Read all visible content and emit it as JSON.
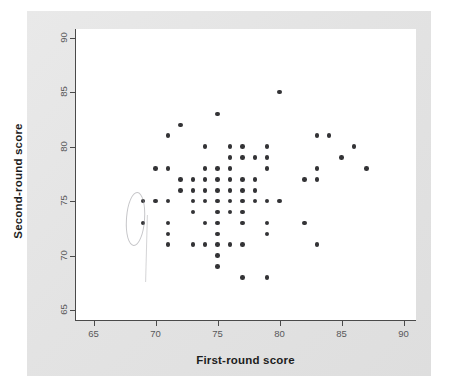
{
  "chart_data": {
    "type": "scatter",
    "title": "",
    "xlabel": "First-round score",
    "ylabel": "Second-round score",
    "xlim": [
      63.5,
      91
    ],
    "ylim": [
      64,
      90.8
    ],
    "xticks": [
      65,
      70,
      75,
      80,
      85,
      90
    ],
    "yticks": [
      65,
      70,
      75,
      80,
      85,
      90
    ],
    "xticklabels": [
      "65",
      "70",
      "75",
      "80",
      "85",
      "90"
    ],
    "yticklabels": [
      "65",
      "70",
      "75",
      "80",
      "85",
      "90"
    ],
    "grid": false,
    "legend": null,
    "marker": "filled-circle",
    "marker_color": "#333336",
    "points": [
      [
        69,
        75
      ],
      [
        69,
        73
      ],
      [
        70,
        75
      ],
      [
        70,
        78
      ],
      [
        71,
        81
      ],
      [
        71,
        78
      ],
      [
        71,
        75
      ],
      [
        71,
        73
      ],
      [
        71,
        72
      ],
      [
        71,
        71
      ],
      [
        72,
        82
      ],
      [
        72,
        77
      ],
      [
        72,
        76
      ],
      [
        73,
        77
      ],
      [
        73,
        76
      ],
      [
        73,
        75
      ],
      [
        73,
        74
      ],
      [
        73,
        71
      ],
      [
        74,
        80
      ],
      [
        74,
        78
      ],
      [
        74,
        77
      ],
      [
        74,
        76
      ],
      [
        74,
        75
      ],
      [
        74,
        73
      ],
      [
        74,
        71
      ],
      [
        75,
        83
      ],
      [
        75,
        78
      ],
      [
        75,
        77
      ],
      [
        75,
        76
      ],
      [
        75,
        75
      ],
      [
        75,
        74
      ],
      [
        75,
        73
      ],
      [
        75,
        72
      ],
      [
        75,
        71
      ],
      [
        75,
        70
      ],
      [
        75,
        69
      ],
      [
        76,
        80
      ],
      [
        76,
        79
      ],
      [
        76,
        78
      ],
      [
        76,
        77
      ],
      [
        76,
        76
      ],
      [
        76,
        75
      ],
      [
        76,
        74
      ],
      [
        76,
        71
      ],
      [
        77,
        80
      ],
      [
        77,
        79
      ],
      [
        77,
        77
      ],
      [
        77,
        76
      ],
      [
        77,
        75
      ],
      [
        77,
        74
      ],
      [
        77,
        73
      ],
      [
        77,
        71
      ],
      [
        77,
        68
      ],
      [
        78,
        79
      ],
      [
        78,
        77
      ],
      [
        78,
        76
      ],
      [
        78,
        75
      ],
      [
        79,
        80
      ],
      [
        79,
        79
      ],
      [
        79,
        78
      ],
      [
        79,
        75
      ],
      [
        79,
        73
      ],
      [
        79,
        72
      ],
      [
        79,
        68
      ],
      [
        80,
        85
      ],
      [
        80,
        75
      ],
      [
        82,
        77
      ],
      [
        82,
        73
      ],
      [
        83,
        81
      ],
      [
        83,
        78
      ],
      [
        83,
        77
      ],
      [
        83,
        71
      ],
      [
        84,
        81
      ],
      [
        85,
        79
      ],
      [
        86,
        80
      ],
      [
        87,
        78
      ]
    ],
    "annotations": [
      {
        "name": "pencil-ellipse",
        "shape": "ellipse",
        "description": "faint hand-drawn pencil ellipse circling the leftmost points near first-round score 69"
      }
    ]
  },
  "figure": {
    "panel_color": "#e6e6e6",
    "plot_background": "#ffffff",
    "axis_color": "#4a4a4a",
    "label_color": "#1d1d1d",
    "tick_label_color": "#58585a"
  }
}
